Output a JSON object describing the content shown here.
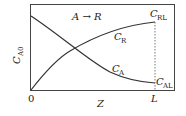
{
  "diagram": {
    "reaction": "A → R",
    "y_axis_label": {
      "main": "C",
      "sub": "A0"
    },
    "x_axis_label": "Z",
    "x_origin_tick": "0",
    "x_end_tick": "L",
    "curves": [
      {
        "name": "C_R",
        "main": "C",
        "sub": "R",
        "trend": "increasing from 0 to C_RL"
      },
      {
        "name": "C_A",
        "main": "C",
        "sub": "A",
        "trend": "decreasing from C_A0 to C_AL"
      }
    ],
    "end_labels": [
      {
        "main": "C",
        "sub": "RL"
      },
      {
        "main": "C",
        "sub": "AL"
      }
    ],
    "colors": {
      "line": "#333333",
      "background": "#ffffff"
    }
  }
}
